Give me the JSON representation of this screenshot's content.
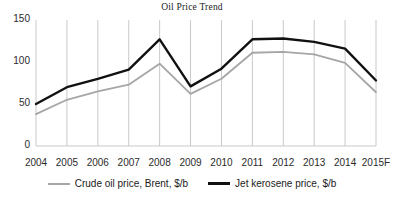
{
  "chart_data": {
    "type": "line",
    "title": "Oil Price Trend",
    "xlabel": "",
    "ylabel": "",
    "categories": [
      "2004",
      "2005",
      "2006",
      "2007",
      "2008",
      "2009",
      "2010",
      "2011",
      "2012",
      "2013",
      "2014",
      "2015F"
    ],
    "series": [
      {
        "name": "Crude oil price, Brent, $/b",
        "color": "#a6a6a6",
        "values": [
          38,
          55,
          65,
          73,
          98,
          62,
          80,
          111,
          112,
          109,
          99,
          64
        ]
      },
      {
        "name": "Jet kerosene price, $/b",
        "color": "#111111",
        "values": [
          50,
          70,
          80,
          91,
          127,
          71,
          92,
          127,
          128,
          124,
          116,
          78
        ]
      }
    ],
    "ylim": [
      0,
      150
    ],
    "yticks": [
      0,
      50,
      100,
      150
    ],
    "ytick_labels": [
      "0",
      "50",
      "100",
      "150"
    ],
    "grid": "vertical-only",
    "legend_position": "bottom"
  },
  "legend": {
    "items": [
      {
        "label": "Crude oil price, Brent, $/b"
      },
      {
        "label": "Jet kerosene price, $/b"
      }
    ]
  },
  "colors": {
    "crude_line": "#a6a6a6",
    "jet_line": "#111111",
    "gridline": "#c9c9c9",
    "axis_text": "#2b2b2b",
    "background": "#ffffff"
  }
}
